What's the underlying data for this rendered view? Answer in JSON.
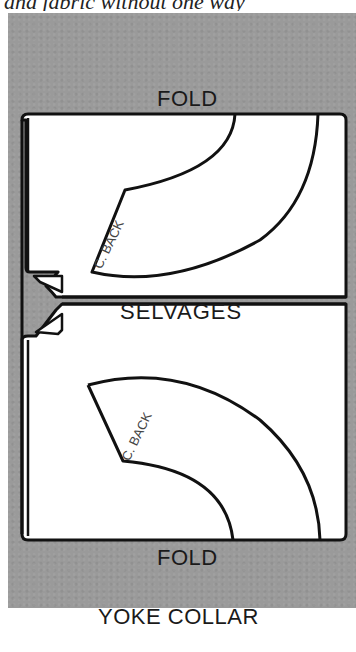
{
  "caption_top": "and fabric without one way",
  "diagram": {
    "title": "YOKE COLLAR",
    "labels": {
      "fold_top": "FOLD",
      "selvages": "SELVAGES",
      "fold_bottom": "FOLD"
    },
    "pieces": [
      {
        "name": "collar-piece-top",
        "label": "C. BACK"
      },
      {
        "name": "collar-piece-bottom",
        "label": "C. BACK"
      }
    ],
    "colors": {
      "background_panel": "#9a9a9a",
      "fabric": "#ffffff",
      "outline": "#111111"
    }
  }
}
